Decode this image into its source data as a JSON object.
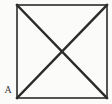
{
  "figure": {
    "caption_label": "A",
    "background_color": "#fbfbfa",
    "stroke_color": "#2b2b2b",
    "square": {
      "left": 17,
      "top": 5,
      "right": 107,
      "bottom": 98,
      "border_width": 1.6
    },
    "diagonals": {
      "width": 2.4,
      "intersection_x": 62,
      "intersection_y": 51.5,
      "lines": [
        {
          "name": "diagonal-top-left-to-bottom-right",
          "x1": 17,
          "y1": 5,
          "x2": 107,
          "y2": 98
        },
        {
          "name": "diagonal-bottom-left-to-top-right",
          "x1": 17,
          "y1": 98,
          "x2": 107,
          "y2": 5
        }
      ]
    }
  },
  "chart_data": {
    "type": "diagram",
    "title": "A",
    "shape": "square-with-both-diagonals",
    "vertices": [
      {
        "name": "top-left",
        "x": 17,
        "y": 5
      },
      {
        "name": "top-right",
        "x": 107,
        "y": 5
      },
      {
        "name": "bottom-right",
        "x": 107,
        "y": 98
      },
      {
        "name": "bottom-left",
        "x": 17,
        "y": 98
      }
    ],
    "edges": [
      {
        "from": "top-left",
        "to": "top-right"
      },
      {
        "from": "top-right",
        "to": "bottom-right"
      },
      {
        "from": "bottom-right",
        "to": "bottom-left"
      },
      {
        "from": "bottom-left",
        "to": "top-left"
      }
    ],
    "diagonals": [
      {
        "from": "top-left",
        "to": "bottom-right"
      },
      {
        "from": "bottom-left",
        "to": "top-right"
      }
    ],
    "annotations": [
      {
        "text": "A",
        "x": 7,
        "y": 90,
        "position": "outside-bottom-left"
      }
    ]
  }
}
